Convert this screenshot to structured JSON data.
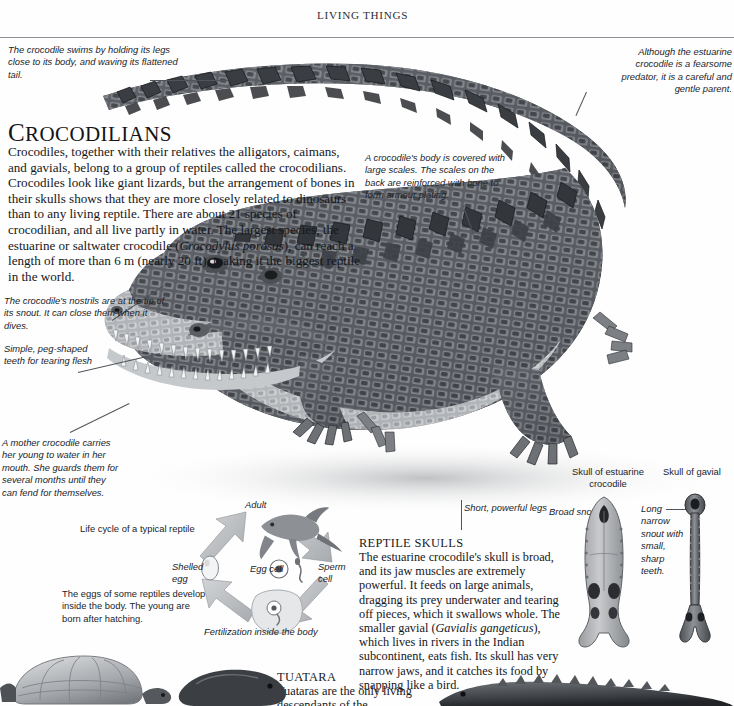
{
  "running_head": "LIVING THINGS",
  "title": {
    "initial": "C",
    "rest": "ROCODILIANS"
  },
  "intro": "Crocodiles, together with their relatives the alligators, caimans, and gavials, belong to a group of reptiles called the crocodilians. Crocodiles look like giant lizards, but the arrangement of bones in their skulls shows that they are more closely related to dinosaurs than to any living reptile. There are about 21 species of crocodilian, and all live partly in water. The largest species, the estuarine or saltwater crocodile (Crocodylus porosus), can reach a length of more than 6 m (nearly 20 ft), making it the biggest reptile in the world.",
  "intro_species_italic": "Crocodylus porosus",
  "callouts": {
    "swim": "The crocodile swims by holding its legs close to its body, and waving its flattened tail.",
    "gentle_parent": "Although the estuarine crocodile is a fearsome predator, it is a careful and gentle parent.",
    "scales": "A crocodile's body is covered with large scales. The scales on the back are reinforced with bone to form armour plating.",
    "nostrils": "The crocodile's nostrils are at the tip of its snout. It can close them when it dives.",
    "teeth": "Simple, peg-shaped teeth for tearing flesh",
    "mother": "A mother crocodile carries her young to water in her mouth. She guards them for several months until they can fend for themselves.",
    "legs": "Short, powerful legs",
    "eggs_develop": "The eggs of some reptiles develop inside the body. The young are born after hatching.",
    "broad_snout": "Broad snout",
    "long_snout": "Long narrow snout with small, sharp teeth."
  },
  "skull_labels": {
    "estuarine": "Skull of estuarine crocodile",
    "gavial": "Skull of gavial"
  },
  "reptile_skulls": {
    "heading": "REPTILE SKULLS",
    "body_part1": "The estuarine crocodile's skull is broad, and its jaw muscles are extremely powerful. It feeds on large animals, dragging its prey underwater and tearing off pieces, which it swallows whole. The smaller gavial (",
    "body_species": "Gavialis gangeticus",
    "body_part2": "), which lives in rivers in the Indian subcontinent, eats fish. Its skull has very narrow jaws, and it catches its food by snapping like a bird."
  },
  "tuatara": {
    "heading": "TUATARA",
    "body": "Tuataras are the only living descendants of the"
  },
  "life_cycle": {
    "caption": "Life cycle of a typical reptile",
    "adult": "Adult",
    "egg_cell": "Egg cell",
    "sperm_cell": "Sperm cell",
    "shelled_egg": "Shelled egg",
    "fertilization": "Fertilization inside the body"
  },
  "colors": {
    "rule": "#8d9097",
    "text": "#15171c",
    "caption_text": "#20242b",
    "leader": "#50555c",
    "arrow": "#b9bcc0"
  }
}
